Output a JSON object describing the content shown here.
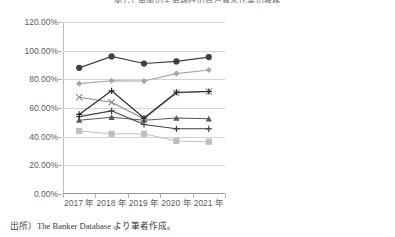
{
  "chart_data": {
    "type": "line",
    "title": "図7-1  英国の主要銀行の自己資本比率の推移",
    "xlabel": "",
    "ylabel": "",
    "categories": [
      "2017 年",
      "2018 年",
      "2019 年",
      "2020 年",
      "2021 年"
    ],
    "ylim": [
      0,
      120
    ],
    "ytick_step": 20,
    "ytick_labels": [
      "0.00%",
      "20.00%",
      "40.00%",
      "60.00%",
      "80.00%",
      "100.00%",
      "120.00%"
    ],
    "ytick_values": [
      0,
      20,
      40,
      60,
      80,
      100,
      120
    ],
    "grid": true,
    "legend_position": "right",
    "series": [
      {
        "name": "Santander UK",
        "values": [
          77.0,
          79.0,
          78.8,
          84.0,
          86.5
        ],
        "color": "#a6a6a6",
        "marker": "diamond"
      },
      {
        "name": "Barclays",
        "values": [
          44.0,
          42.0,
          42.0,
          37.0,
          36.5
        ],
        "color": "#bfbfbf",
        "marker": "square"
      },
      {
        "name": "HSBC Holdings",
        "values": [
          51.5,
          53.5,
          51.5,
          53.0,
          52.5
        ],
        "color": "#595959",
        "marker": "triangle"
      },
      {
        "name": "Lloyds Banking Group",
        "values": [
          54.0,
          58.0,
          48.5,
          45.5,
          45.5
        ],
        "color": "#404040",
        "marker": "cross"
      },
      {
        "name": "NatWest Group",
        "values": [
          67.5,
          64.0,
          52.5,
          70.5,
          71.5
        ],
        "color": "#8c8c8c",
        "marker": "x"
      },
      {
        "name": "Nationwide Building Society",
        "values": [
          88.0,
          96.0,
          91.0,
          92.5,
          95.5
        ],
        "color": "#3f3f3f",
        "marker": "circle"
      },
      {
        "name": "Standard Chartered",
        "values": [
          55.5,
          72.0,
          53.0,
          71.0,
          71.5
        ],
        "color": "#262626",
        "marker": "plus"
      }
    ]
  },
  "legend": {
    "items": [
      {
        "label": "Santander UK"
      },
      {
        "label": "Barclays"
      },
      {
        "label": "HSBC Holdings"
      },
      {
        "label": "Lloyds Banking Group"
      },
      {
        "label": "NatWest Group"
      },
      {
        "label": "Nationwide Building\nSociety"
      },
      {
        "label": "Standard Chartered"
      }
    ]
  },
  "footnote": {
    "text": "出所）The Banker Database より筆者作成。"
  }
}
